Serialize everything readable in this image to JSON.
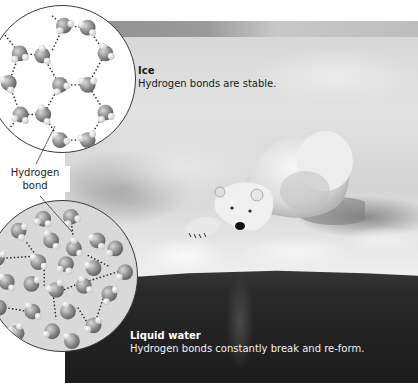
{
  "figure": {
    "ice": {
      "title": "Ice",
      "description": "Hydrogen bonds are stable."
    },
    "liquid_water": {
      "title": "Liquid water",
      "description": "Hydrogen bonds constantly break and re-form."
    },
    "callout": {
      "line1": "Hydrogen",
      "line2": "bond"
    },
    "photo": {
      "subject": "polar-bear-on-ice-edge-over-water"
    },
    "insets": [
      {
        "name": "ice-lattice",
        "arrangement": "hexagonal",
        "bonds": "dotted"
      },
      {
        "name": "liquid-water-molecules",
        "arrangement": "random",
        "bonds": "dotted"
      }
    ],
    "colors": {
      "ice_inset_bg": "#ffffff",
      "water_inset_bg": "#d9d9d9",
      "molecule_oxygen": "#8c8c8c",
      "molecule_hydrogen": "#e6e6e6",
      "bond_dots": "#222222",
      "ice_label_text": "#1a1a1a",
      "water_label_text": "#f2f2f2"
    }
  }
}
